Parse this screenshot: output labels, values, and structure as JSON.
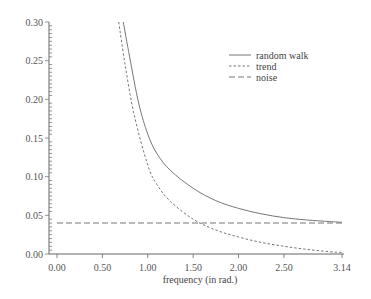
{
  "chart_data": {
    "type": "line",
    "title": "",
    "xlabel": "frequency (in rad.)",
    "ylabel": "",
    "xlim": [
      0,
      3.14
    ],
    "ylim": [
      0,
      0.3
    ],
    "x_ticks": [
      "0.00",
      "0.50",
      "1.00",
      "1.50",
      "2.00",
      "2.50",
      "3.14"
    ],
    "y_ticks": [
      "0.00",
      "0.05",
      "0.10",
      "0.15",
      "0.20",
      "0.25",
      "0.30"
    ],
    "grid": false,
    "legend_position": "upper right",
    "series": [
      {
        "name": "random walk",
        "style": "solid",
        "x": [
          0.73,
          0.8,
          0.9,
          1.0,
          1.1,
          1.25,
          1.5,
          1.75,
          2.0,
          2.25,
          2.5,
          2.75,
          3.0,
          3.14
        ],
        "values": [
          0.3,
          0.255,
          0.195,
          0.155,
          0.13,
          0.108,
          0.085,
          0.069,
          0.059,
          0.052,
          0.047,
          0.044,
          0.042,
          0.041
        ]
      },
      {
        "name": "trend",
        "style": "dotted",
        "x": [
          0.68,
          0.75,
          0.85,
          1.0,
          1.1,
          1.25,
          1.5,
          1.75,
          2.0,
          2.25,
          2.5,
          2.75,
          3.0,
          3.14
        ],
        "values": [
          0.3,
          0.245,
          0.18,
          0.115,
          0.09,
          0.068,
          0.045,
          0.031,
          0.022,
          0.015,
          0.01,
          0.006,
          0.003,
          0.002
        ]
      },
      {
        "name": "noise",
        "style": "dashed",
        "x": [
          0.0,
          3.14
        ],
        "values": [
          0.04,
          0.04
        ]
      }
    ]
  },
  "legend": {
    "items": [
      "random walk",
      "trend",
      "noise"
    ]
  }
}
